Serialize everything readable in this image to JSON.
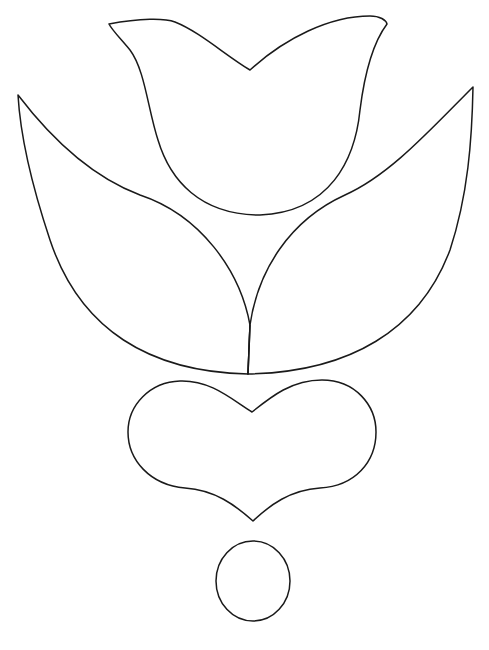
{
  "page": {
    "title": "Tulip, heart and circle coloring page"
  },
  "colors": {
    "background": "#ffffff",
    "stroke": "#1a1a1a"
  },
  "shapes": [
    {
      "name": "tulip-flower",
      "description": "tulip cup with V-notch top"
    },
    {
      "name": "left-leaf",
      "description": "large curved leaf on left"
    },
    {
      "name": "right-leaf",
      "description": "large curved leaf on right"
    },
    {
      "name": "stem",
      "description": "short vertical stem between leaves"
    },
    {
      "name": "heart",
      "description": "wide heart shape below tulip"
    },
    {
      "name": "circle",
      "description": "small circle at bottom"
    }
  ]
}
